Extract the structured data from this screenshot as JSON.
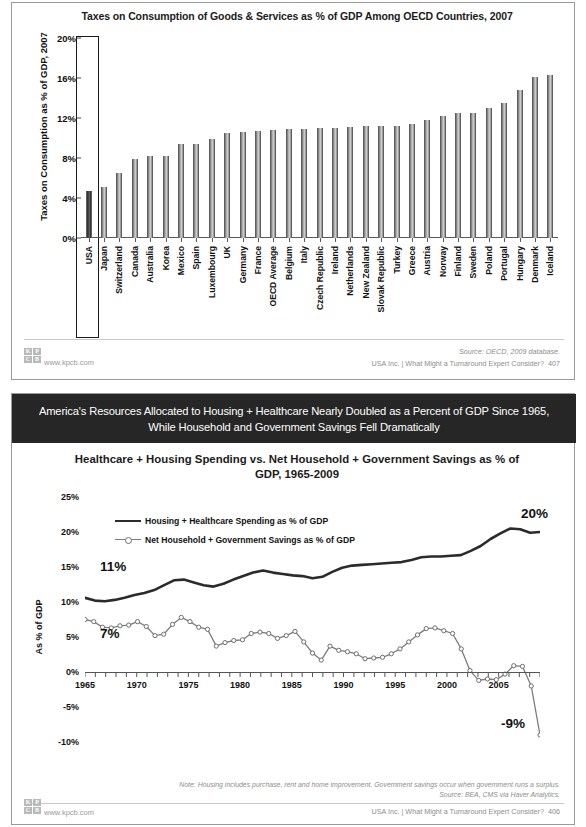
{
  "slide1": {
    "title": "Taxes on Consumption of Goods & Services as % of GDP Among OECD Countries, 2007",
    "y_axis_label": "Taxes on Consumption as % of GDP, 2007",
    "source": "Source: OECD, 2009 database.",
    "footer_right": "USA Inc. | What Might a Turnaround Expert Consider?",
    "page_number": "407",
    "kpcb_url": "www.kpcb.com",
    "logo_letters": [
      "K",
      "P",
      "C",
      "B"
    ]
  },
  "slide2": {
    "banner": "America's Resources Allocated to Housing + Healthcare Nearly Doubled as a Percent of GDP Since 1965, While Household and Government Savings Fell Dramatically",
    "title": "Healthcare + Housing Spending vs. Net Household + Government Savings as % of GDP, 1965-2009",
    "y_axis_label": "As % of GDP",
    "note": "Note: Housing includes purchase, rent and home improvement. Government savings occur when government runs a surplus.",
    "source": "Source: BEA, CMS via Haver Analytics.",
    "footer_right": "USA Inc. | What Might a Turnaround Expert Consider?",
    "page_number": "406",
    "kpcb_url": "www.kpcb.com",
    "logo_letters": [
      "K",
      "P",
      "C",
      "B"
    ],
    "annotations": [
      {
        "text": "11%",
        "series": "housing_healthcare",
        "at_year": 1965
      },
      {
        "text": "7%",
        "series": "net_savings",
        "at_year": 1965
      },
      {
        "text": "20%",
        "series": "housing_healthcare",
        "at_year": 2009
      },
      {
        "text": "-9%",
        "series": "net_savings",
        "at_year": 2009
      }
    ]
  },
  "chart_data": [
    {
      "type": "bar",
      "title": "Taxes on Consumption of Goods & Services as % of GDP Among OECD Countries, 2007",
      "xlabel": "",
      "ylabel": "Taxes on Consumption as % of GDP, 2007",
      "ylim": [
        0,
        20
      ],
      "yticks": [
        "0%",
        "4%",
        "8%",
        "12%",
        "16%",
        "20%"
      ],
      "ytick_values": [
        0,
        4,
        8,
        12,
        16,
        20
      ],
      "grid": false,
      "highlight_category": "USA",
      "categories": [
        "USA",
        "Japan",
        "Switzerland",
        "Canada",
        "Australia",
        "Korea",
        "Mexico",
        "Spain",
        "Luxembourg",
        "UK",
        "Germany",
        "France",
        "OECD Average",
        "Belgium",
        "Italy",
        "Czech Republic",
        "Ireland",
        "Netherlands",
        "New Zealand",
        "Slovak Republic",
        "Turkey",
        "Greece",
        "Austria",
        "Norway",
        "Finland",
        "Sweden",
        "Poland",
        "Portugal",
        "Hungary",
        "Denmark",
        "Iceland"
      ],
      "values": [
        4.7,
        5.1,
        6.5,
        7.9,
        8.2,
        8.2,
        9.4,
        9.4,
        9.9,
        10.5,
        10.6,
        10.7,
        10.8,
        10.9,
        10.9,
        11.0,
        11.0,
        11.1,
        11.2,
        11.2,
        11.2,
        11.4,
        11.8,
        12.2,
        12.5,
        12.5,
        13.0,
        13.5,
        14.8,
        16.1,
        16.3
      ]
    },
    {
      "type": "line",
      "title": "Healthcare + Housing Spending vs. Net Household + Government Savings as % of GDP, 1965-2009",
      "xlabel": "",
      "ylabel": "As % of GDP",
      "ylim": [
        -10,
        25
      ],
      "yticks": [
        "25%",
        "20%",
        "15%",
        "10%",
        "5%",
        "0%",
        "-5%",
        "-10%"
      ],
      "ytick_values": [
        25,
        20,
        15,
        10,
        5,
        0,
        -5,
        -10
      ],
      "xticks": [
        "1965",
        "1970",
        "1975",
        "1980",
        "1985",
        "1990",
        "1995",
        "2000",
        "2005"
      ],
      "xtick_values": [
        1965,
        1970,
        1975,
        1980,
        1985,
        1990,
        1995,
        2000,
        2005
      ],
      "xlim": [
        1965,
        2009
      ],
      "grid": false,
      "legend_position": "top-left",
      "x": [
        1965,
        1966,
        1967,
        1968,
        1969,
        1970,
        1971,
        1972,
        1973,
        1974,
        1975,
        1976,
        1977,
        1978,
        1979,
        1980,
        1981,
        1982,
        1983,
        1984,
        1985,
        1986,
        1987,
        1988,
        1989,
        1990,
        1991,
        1992,
        1993,
        1994,
        1995,
        1996,
        1997,
        1998,
        1999,
        2000,
        2001,
        2002,
        2003,
        2004,
        2005,
        2006,
        2007,
        2008,
        2009
      ],
      "series": [
        {
          "name": "Housing + Healthcare Spending as % of GDP",
          "style": "solid-thick",
          "color": "#2b2b2b",
          "values": [
            10.6,
            10.2,
            10.1,
            10.3,
            10.6,
            11.0,
            11.3,
            11.7,
            12.4,
            13.1,
            13.2,
            12.8,
            12.4,
            12.2,
            12.6,
            13.2,
            13.7,
            14.2,
            14.5,
            14.2,
            14.0,
            13.8,
            13.7,
            13.4,
            13.6,
            14.3,
            14.9,
            15.2,
            15.3,
            15.4,
            15.5,
            15.6,
            15.7,
            16.0,
            16.4,
            16.5,
            16.5,
            16.6,
            16.7,
            17.3,
            18.0,
            19.0,
            19.8,
            20.5,
            20.4,
            19.9,
            20.0
          ]
        },
        {
          "name": "Net Household + Government Savings as % of GDP",
          "style": "line-markers",
          "color": "#7c7c7c",
          "values": [
            7.5,
            7.2,
            6.4,
            6.3,
            6.6,
            6.7,
            7.2,
            6.5,
            5.2,
            5.4,
            6.8,
            7.8,
            7.2,
            6.4,
            6.1,
            3.7,
            4.2,
            4.5,
            4.6,
            5.5,
            5.7,
            5.5,
            4.8,
            5.2,
            5.8,
            4.3,
            2.7,
            1.7,
            3.7,
            3.1,
            2.9,
            2.6,
            1.9,
            2.0,
            2.1,
            2.6,
            3.3,
            4.3,
            5.3,
            6.2,
            6.3,
            5.9,
            5.5,
            3.3,
            0.2,
            -1.2,
            -1.0,
            -1.1,
            -0.3,
            0.9,
            0.8,
            -2.0,
            -9.0
          ]
        }
      ]
    }
  ]
}
